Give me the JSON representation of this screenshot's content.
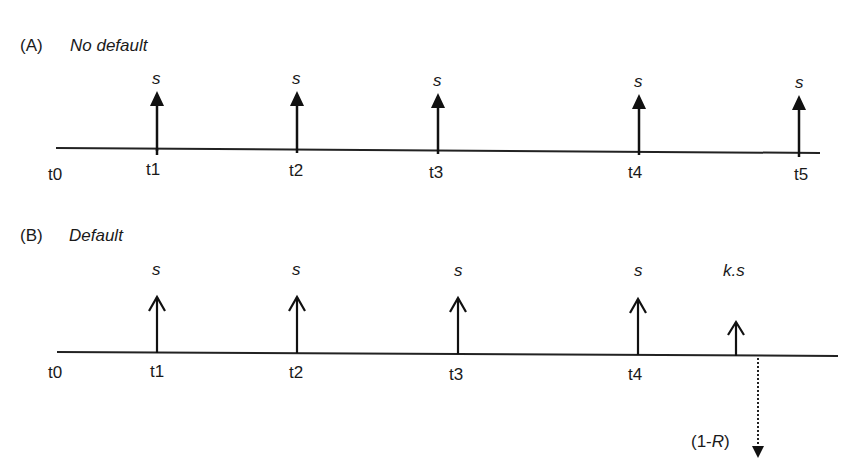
{
  "panels": [
    {
      "id": "A",
      "prefix": "(A)",
      "title": "No default",
      "timeline": {
        "start_label": "t0",
        "ticks": [
          {
            "label": "t1",
            "payment": "s",
            "direction": "up"
          },
          {
            "label": "t2",
            "payment": "s",
            "direction": "up"
          },
          {
            "label": "t3",
            "payment": "s",
            "direction": "up"
          },
          {
            "label": "t4",
            "payment": "s",
            "direction": "up"
          },
          {
            "label": "t5",
            "payment": "s",
            "direction": "up"
          }
        ]
      }
    },
    {
      "id": "B",
      "prefix": "(B)",
      "title": "Default",
      "timeline": {
        "start_label": "t0",
        "ticks": [
          {
            "label": "t1",
            "payment": "s",
            "direction": "up"
          },
          {
            "label": "t2",
            "payment": "s",
            "direction": "up"
          },
          {
            "label": "t3",
            "payment": "s",
            "direction": "up"
          },
          {
            "label": "t4",
            "payment": "s",
            "direction": "up"
          }
        ],
        "accrued_payment": {
          "label_prefix": "k.",
          "label_var": "s",
          "direction": "up"
        },
        "default_payment": {
          "label_pre": "(1-",
          "label_var": "R",
          "label_post": ")",
          "direction": "down",
          "style": "dotted"
        }
      }
    }
  ]
}
